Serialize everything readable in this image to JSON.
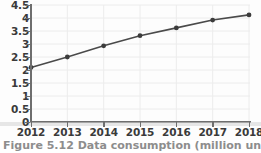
{
  "chart_data": {
    "type": "line",
    "title": "",
    "xlabel": "",
    "ylabel": "",
    "categories": [
      "2012",
      "2013",
      "2014",
      "2015",
      "2016",
      "2017",
      "2018"
    ],
    "x": [
      2012,
      2013,
      2014,
      2015,
      2016,
      2017,
      2018
    ],
    "values": [
      2.1,
      2.5,
      2.93,
      3.32,
      3.62,
      3.92,
      4.12
    ],
    "series": [
      {
        "name": "series-1",
        "values": [
          2.1,
          2.5,
          2.93,
          3.32,
          3.62,
          3.92,
          4.12
        ]
      }
    ],
    "ylim": [
      0,
      4.5
    ],
    "yticks": [
      0,
      0.5,
      1,
      1.5,
      2,
      2.5,
      3,
      3.5,
      4,
      4.5
    ],
    "ytick_labels": [
      "0",
      "0.5",
      "1",
      "1.5",
      "2",
      "2.5",
      "3",
      "3.5",
      "4",
      "4.5"
    ],
    "xtick_labels": [
      "2012",
      "2013",
      "2014",
      "2015",
      "2016",
      "2017",
      "2018"
    ],
    "grid": true,
    "legend": "none",
    "marker": "circle",
    "line_color": "#4a4a4a",
    "marker_color": "#3c3c3c",
    "grid_color": "#ececec",
    "axis_color": "#6e6e6e",
    "background_color": "#fdfdfd",
    "annotations": []
  },
  "caption": {
    "text": "Figure 5.12 Data consumption (million units)"
  }
}
